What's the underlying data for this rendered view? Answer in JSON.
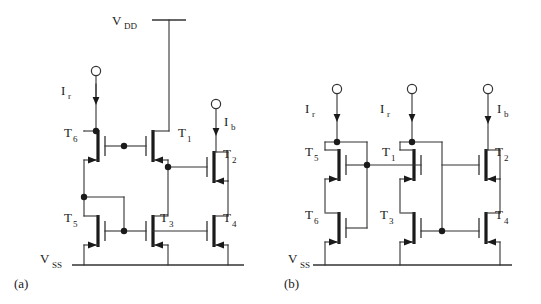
{
  "figure": {
    "background_color": "#ffffff",
    "line_color": "#333333",
    "device_color": "#1a1a1a",
    "text_color": "#1a1a1a"
  },
  "panels": [
    {
      "id": "a",
      "label": "(a)",
      "rails": [
        {
          "name": "vdd",
          "label": "V",
          "sub": "DD"
        },
        {
          "name": "vss",
          "label": "V",
          "sub": "SS"
        }
      ],
      "current_terminals": [
        {
          "name": "ir-left",
          "label": "I",
          "sub": "r",
          "direction": "down",
          "side": "left"
        },
        {
          "name": "ib-right",
          "label": "I",
          "sub": "b",
          "direction": "down",
          "side": "right"
        }
      ],
      "transistors": [
        {
          "name": "T6",
          "label": "T",
          "sub": "6",
          "gate_side": "right",
          "position": "upper-left"
        },
        {
          "name": "T1",
          "label": "T",
          "sub": "1",
          "gate_side": "right",
          "position": "upper-middle"
        },
        {
          "name": "T2",
          "label": "T",
          "sub": "2",
          "gate_side": "left",
          "position": "upper-right"
        },
        {
          "name": "T5",
          "label": "T",
          "sub": "5",
          "gate_side": "right",
          "position": "lower-left"
        },
        {
          "name": "T3",
          "label": "T",
          "sub": "3",
          "gate_side": "right",
          "position": "lower-middle"
        },
        {
          "name": "T4",
          "label": "T",
          "sub": "4",
          "gate_side": "left",
          "position": "lower-right"
        }
      ]
    },
    {
      "id": "b",
      "label": "(b)",
      "rails": [
        {
          "name": "vss",
          "label": "V",
          "sub": "SS"
        }
      ],
      "current_terminals": [
        {
          "name": "ir-left",
          "label": "I",
          "sub": "r",
          "direction": "down",
          "side": "left"
        },
        {
          "name": "ir-middle",
          "label": "I",
          "sub": "r",
          "direction": "down",
          "side": "middle"
        },
        {
          "name": "ib-right",
          "label": "I",
          "sub": "b",
          "direction": "down",
          "side": "right"
        }
      ],
      "transistors": [
        {
          "name": "T5",
          "label": "T",
          "sub": "5",
          "gate_side": "right",
          "position": "upper-left"
        },
        {
          "name": "T1",
          "label": "T",
          "sub": "1",
          "gate_side": "right",
          "position": "upper-middle"
        },
        {
          "name": "T2",
          "label": "T",
          "sub": "2",
          "gate_side": "left",
          "position": "upper-right"
        },
        {
          "name": "T6",
          "label": "T",
          "sub": "6",
          "gate_side": "right",
          "position": "lower-left"
        },
        {
          "name": "T3",
          "label": "T",
          "sub": "3",
          "gate_side": "right",
          "position": "lower-middle"
        },
        {
          "name": "T4",
          "label": "T",
          "sub": "4",
          "gate_side": "left",
          "position": "lower-right"
        }
      ]
    }
  ]
}
